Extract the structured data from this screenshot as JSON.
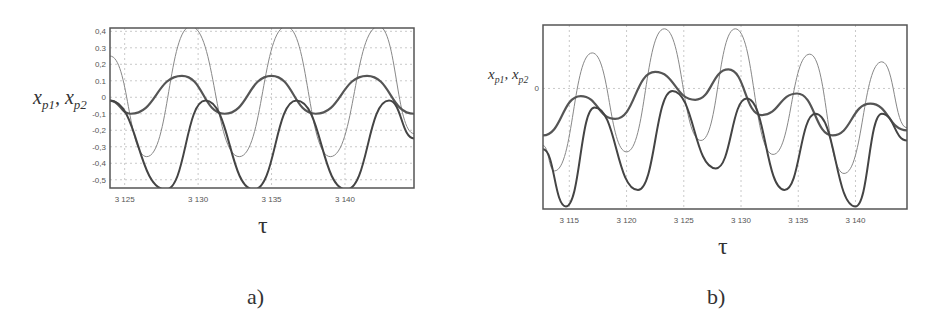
{
  "figure": {
    "panels": [
      {
        "id": "a",
        "caption": "a)",
        "xlabel": "τ",
        "ylabel_var1": "x",
        "ylabel_sub1": "p1",
        "ylabel_sep": ", ",
        "ylabel_var2": "x",
        "ylabel_sub2": "p2"
      },
      {
        "id": "b",
        "caption": "b)",
        "xlabel": "τ",
        "ylabel_var1": "x",
        "ylabel_sub1": "p1",
        "ylabel_sep": ", ",
        "ylabel_var2": "x",
        "ylabel_sub2": "p2"
      }
    ]
  },
  "chart_data": [
    {
      "type": "line",
      "title": "a)",
      "xlabel": "τ",
      "ylabel": "x_p1, x_p2",
      "xlim": [
        3124,
        3144.7
      ],
      "ylim": [
        -0.55,
        0.42
      ],
      "x_ticks": [
        "3 125",
        "3 130",
        "3 135",
        "3 140"
      ],
      "x_tick_values": [
        3125,
        3130,
        3135,
        3140
      ],
      "y_ticks": [
        "0,4",
        "0.3",
        "0,2",
        "0.1",
        "0",
        "-0,1",
        "-0,2",
        "-0,3",
        "-0,4",
        "-0,5"
      ],
      "y_tick_values": [
        0.4,
        0.3,
        0.2,
        0.1,
        0,
        -0.1,
        -0.2,
        -0.3,
        -0.4,
        -0.5
      ],
      "grid": true,
      "series": [
        {
          "name": "thin large-amplitude",
          "x": [
            3124,
            3126.5,
            3129.5,
            3132.8,
            3136,
            3139,
            3142.3,
            3144.7
          ],
          "values": [
            0.25,
            -0.36,
            0.43,
            -0.36,
            0.43,
            -0.36,
            0.43,
            -0.22
          ]
        },
        {
          "name": "thick medium-amplitude",
          "x": [
            3124,
            3125.4,
            3128.9,
            3131.8,
            3135,
            3138,
            3141.5,
            3144.7
          ],
          "values": [
            -0.02,
            -0.1,
            0.13,
            -0.1,
            0.13,
            -0.1,
            0.13,
            -0.1
          ]
        },
        {
          "name": "thick cusp",
          "x": [
            3124,
            3127.8,
            3130.5,
            3133.8,
            3136.7,
            3140.1,
            3143,
            3144.7
          ],
          "values": [
            -0.02,
            -0.56,
            -0.02,
            -0.56,
            -0.02,
            -0.56,
            -0.02,
            -0.25
          ]
        }
      ]
    },
    {
      "type": "line",
      "title": "b)",
      "xlabel": "τ",
      "ylabel": "x_p1, x_p2",
      "xlim": [
        3112.7,
        3144.5
      ],
      "x_ticks": [
        "3 115",
        "3 120",
        "3 125",
        "3 130",
        "3 135",
        "3 140"
      ],
      "x_tick_values": [
        3115,
        3120,
        3125,
        3130,
        3135,
        3140
      ],
      "y_ticks": [
        "0"
      ],
      "y_tick_values": [
        0
      ],
      "grid": true,
      "series": [
        {
          "name": "thin large-amplitude",
          "x": [
            3112.7,
            3113.7,
            3117,
            3120,
            3123.3,
            3126.5,
            3129.5,
            3132.8,
            3136,
            3139,
            3142.3,
            3144.5
          ],
          "values": [
            -0.45,
            -0.65,
            0.28,
            -0.5,
            0.47,
            -0.41,
            0.47,
            -0.52,
            0.27,
            -0.67,
            0.21,
            -0.31
          ]
        },
        {
          "name": "thick medium-amplitude",
          "x": [
            3112.7,
            3116,
            3119,
            3122.5,
            3126,
            3128.9,
            3131.8,
            3134.9,
            3138,
            3141.3,
            3144.5
          ],
          "values": [
            -0.37,
            -0.06,
            -0.24,
            0.13,
            -0.09,
            0.15,
            -0.21,
            -0.04,
            -0.37,
            -0.12,
            -0.33
          ]
        },
        {
          "name": "thick cusp",
          "x": [
            3112.7,
            3114.7,
            3117.2,
            3121,
            3124,
            3127.8,
            3130.5,
            3133.8,
            3136.5,
            3140,
            3142.3,
            3144.5
          ],
          "values": [
            -0.48,
            -0.93,
            -0.15,
            -0.8,
            -0.02,
            -0.63,
            -0.08,
            -0.8,
            -0.2,
            -0.93,
            -0.2,
            -0.41
          ]
        }
      ]
    }
  ]
}
